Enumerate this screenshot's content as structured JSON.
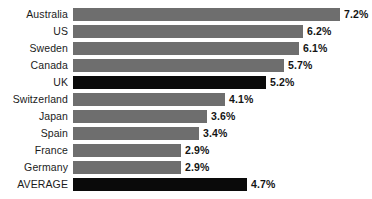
{
  "chart_data": {
    "type": "bar",
    "orientation": "horizontal",
    "title": "",
    "xlabel": "",
    "ylabel": "",
    "grid": false,
    "legend": null,
    "xlim": [
      0,
      7.2
    ],
    "categories": [
      "Australia",
      "US",
      "Sweden",
      "Canada",
      "UK",
      "Switzerland",
      "Japan",
      "Spain",
      "France",
      "Germany",
      "AVERAGE"
    ],
    "values": [
      7.2,
      6.2,
      6.1,
      5.7,
      5.2,
      4.1,
      3.6,
      3.4,
      2.9,
      2.9,
      4.7
    ],
    "value_labels": [
      "7.2%",
      "6.2%",
      "6.1%",
      "5.7%",
      "5.2%",
      "4.1%",
      "3.6%",
      "3.4%",
      "2.9%",
      "2.9%",
      "4.7%"
    ],
    "bar_colors": [
      "#6e6e6e",
      "#6e6e6e",
      "#6e6e6e",
      "#6e6e6e",
      "#0a0a0a",
      "#6e6e6e",
      "#6e6e6e",
      "#6e6e6e",
      "#6e6e6e",
      "#6e6e6e",
      "#0a0a0a"
    ],
    "highlight_categories": [
      "UK",
      "AVERAGE"
    ],
    "colors": {
      "bar_default": "#6e6e6e",
      "bar_highlight": "#0a0a0a",
      "background": "#ffffff",
      "text": "#1b1b1b"
    }
  },
  "rows": [
    {
      "label": "Australia",
      "value_label": "7.2%"
    },
    {
      "label": "US",
      "value_label": "6.2%"
    },
    {
      "label": "Sweden",
      "value_label": "6.1%"
    },
    {
      "label": "Canada",
      "value_label": "5.7%"
    },
    {
      "label": "UK",
      "value_label": "5.2%"
    },
    {
      "label": "Switzerland",
      "value_label": "4.1%"
    },
    {
      "label": "Japan",
      "value_label": "3.6%"
    },
    {
      "label": "Spain",
      "value_label": "3.4%"
    },
    {
      "label": "France",
      "value_label": "2.9%"
    },
    {
      "label": "Germany",
      "value_label": "2.9%"
    },
    {
      "label": "AVERAGE",
      "value_label": "4.7%"
    }
  ]
}
